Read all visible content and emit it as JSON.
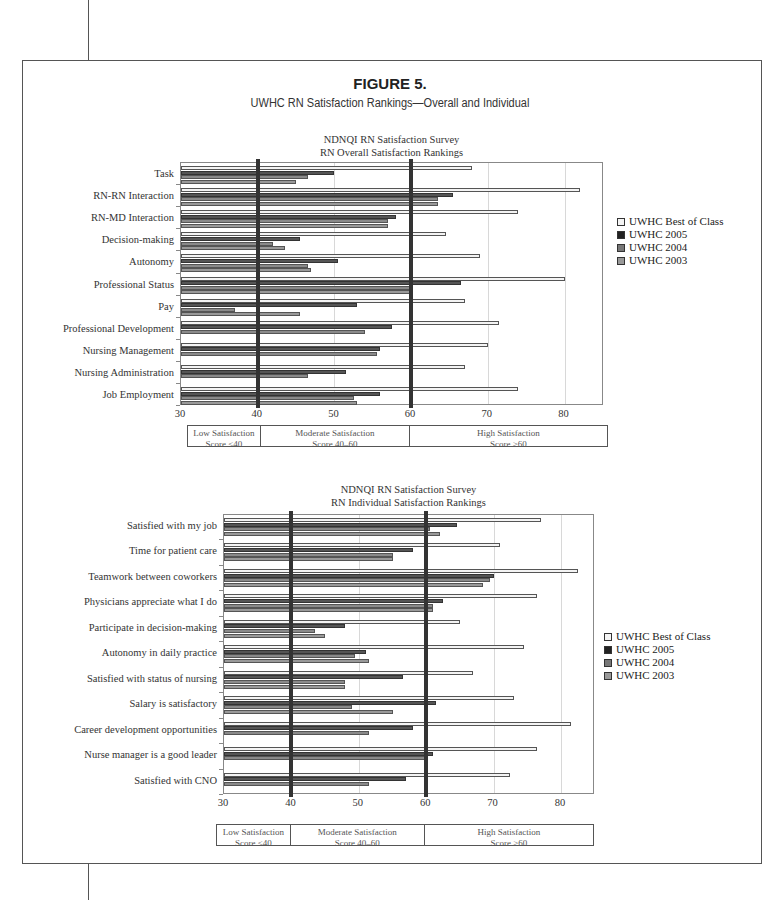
{
  "figure": {
    "label": "FIGURE 5.",
    "subtitle": "UWHC RN Satisfaction Rankings—Overall and Individual"
  },
  "legend": {
    "items": [
      {
        "label": "UWHC Best of Class",
        "color": "#f4f4f4"
      },
      {
        "label": "UWHC 2005",
        "color": "#222222"
      },
      {
        "label": "UWHC 2004",
        "color": "#777777"
      },
      {
        "label": "UWHC 2003",
        "color": "#999999"
      }
    ]
  },
  "zones": [
    {
      "line1": "Low Satisfaction",
      "line2": "Score <40"
    },
    {
      "line1": "Moderate Satisfaction",
      "line2": "Score 40–60"
    },
    {
      "line1": "High Satisfaction",
      "line2": "Score >60"
    }
  ],
  "chart_data": [
    {
      "type": "bar",
      "orientation": "horizontal",
      "title": "NDNQI RN Satisfaction Survey",
      "subtitle": "RN Overall Satisfaction Rankings",
      "xlabel": "",
      "ylabel": "",
      "xlim": [
        30,
        85
      ],
      "xticks": [
        30,
        40,
        50,
        60,
        70,
        80
      ],
      "reference_lines": [
        40,
        60
      ],
      "grid": true,
      "legend_position": "right",
      "categories": [
        "Task",
        "RN-RN Interaction",
        "RN-MD Interaction",
        "Decision-making",
        "Autonomy",
        "Professional Status",
        "Pay",
        "Professional Development",
        "Nursing Management",
        "Nursing Administration",
        "Job Employment"
      ],
      "series": [
        {
          "name": "UWHC Best of Class",
          "values": [
            68,
            82,
            74,
            64.5,
            69,
            80,
            67,
            71.5,
            70,
            67,
            74
          ]
        },
        {
          "name": "UWHC 2005",
          "values": [
            50,
            65.5,
            58,
            45.5,
            50.5,
            66.5,
            53,
            57.5,
            56,
            51.5,
            56
          ]
        },
        {
          "name": "UWHC 2004",
          "values": [
            46.5,
            63.5,
            57,
            42,
            46.5,
            60,
            37,
            54,
            55.5,
            46.5,
            52.5
          ]
        },
        {
          "name": "UWHC 2003",
          "values": [
            45,
            63.5,
            57,
            43.5,
            47,
            60,
            45.5,
            null,
            null,
            null,
            53
          ]
        }
      ]
    },
    {
      "type": "bar",
      "orientation": "horizontal",
      "title": "NDNQI RN Satisfaction Survey",
      "subtitle": "RN Individual Satisfaction Rankings",
      "xlabel": "",
      "ylabel": "",
      "xlim": [
        30,
        85
      ],
      "xticks": [
        30,
        40,
        50,
        60,
        70,
        80
      ],
      "reference_lines": [
        40,
        60
      ],
      "grid": true,
      "legend_position": "right",
      "categories": [
        "Satisfied with my job",
        "Time for patient care",
        "Teamwork between coworkers",
        "Physicians appreciate what I do",
        "Participate in decision-making",
        "Autonomy in daily practice",
        "Satisfied with status of nursing",
        "Salary is satisfactory",
        "Career development opportunities",
        "Nurse manager is a good leader",
        "Satisfied with CNO"
      ],
      "series": [
        {
          "name": "UWHC Best of Class",
          "values": [
            77,
            71,
            82.5,
            76.5,
            65,
            74.5,
            67,
            73,
            81.5,
            76.5,
            72.5
          ]
        },
        {
          "name": "UWHC 2005",
          "values": [
            64.5,
            58,
            70,
            62.5,
            48,
            51,
            56.5,
            61.5,
            58,
            61,
            57
          ]
        },
        {
          "name": "UWHC 2004",
          "values": [
            60.5,
            55,
            69.5,
            61,
            43.5,
            49.5,
            48,
            49,
            51.5,
            60,
            51.5
          ]
        },
        {
          "name": "UWHC 2003",
          "values": [
            62,
            55,
            68.5,
            61,
            45,
            51.5,
            48,
            55,
            null,
            null,
            null
          ]
        }
      ]
    }
  ]
}
